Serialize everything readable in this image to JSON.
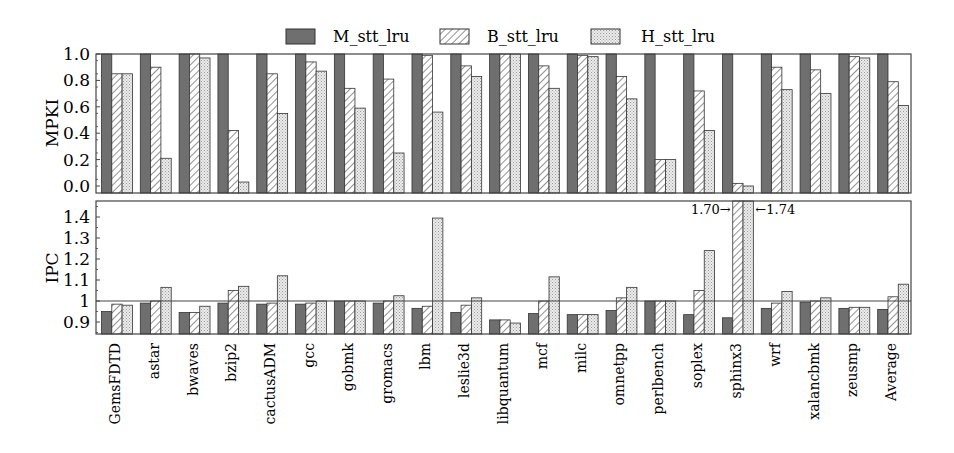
{
  "chart_data": [
    {
      "type": "bar",
      "title": "",
      "panel": "top",
      "ylabel": "MPKI",
      "xlabel": "",
      "ylim": [
        0.0,
        1.0
      ],
      "yticks": [
        "0.0",
        "0.2",
        "0.4",
        "0.6",
        "0.8",
        "1.0"
      ],
      "grid": false,
      "legend_position": "top-center",
      "categories": [
        "GemsFDTD",
        "astar",
        "bwaves",
        "bzip2",
        "cactusADM",
        "gcc",
        "gobmk",
        "gromacs",
        "lbm",
        "leslie3d",
        "libquantum",
        "mcf",
        "milc",
        "omnetpp",
        "perlbench",
        "soplex",
        "sphinx3",
        "wrf",
        "xalancbmk",
        "zeusmp",
        "Average"
      ],
      "series": [
        {
          "name": "M_stt_lru",
          "values": [
            1.0,
            1.0,
            1.0,
            1.0,
            1.0,
            1.0,
            1.0,
            1.0,
            1.0,
            1.0,
            1.0,
            1.0,
            1.0,
            1.0,
            1.0,
            1.0,
            1.0,
            1.0,
            1.0,
            1.0,
            1.0
          ]
        },
        {
          "name": "B_stt_lru",
          "values": [
            0.85,
            0.9,
            1.0,
            0.42,
            0.85,
            0.94,
            0.74,
            0.81,
            0.99,
            0.91,
            1.0,
            0.91,
            0.99,
            0.83,
            0.2,
            0.72,
            0.02,
            0.9,
            0.88,
            0.98,
            0.79
          ]
        },
        {
          "name": "H_stt_lru",
          "values": [
            0.85,
            0.21,
            0.97,
            0.03,
            0.55,
            0.87,
            0.59,
            0.25,
            0.56,
            0.83,
            1.0,
            0.74,
            0.98,
            0.66,
            0.2,
            0.42,
            0.0,
            0.73,
            0.7,
            0.97,
            0.61
          ]
        }
      ]
    },
    {
      "type": "bar",
      "title": "",
      "panel": "bottom",
      "ylabel": "IPC",
      "xlabel": "",
      "ylim": [
        0.85,
        1.48
      ],
      "yticks": [
        "0.9",
        "1",
        "1.1",
        "1.2",
        "1.3",
        "1.4"
      ],
      "reference_line": 1.0,
      "grid": false,
      "annotations": [
        {
          "text": "1.70→",
          "target": "sphinx3 B_stt_lru",
          "value": 1.7
        },
        {
          "text": "←1.74",
          "target": "sphinx3 H_stt_lru",
          "value": 1.74
        }
      ],
      "categories": [
        "GemsFDTD",
        "astar",
        "bwaves",
        "bzip2",
        "cactusADM",
        "gcc",
        "gobmk",
        "gromacs",
        "lbm",
        "leslie3d",
        "libquantum",
        "mcf",
        "milc",
        "omnetpp",
        "perlbench",
        "soplex",
        "sphinx3",
        "wrf",
        "xalancbmk",
        "zeusmp",
        "Average"
      ],
      "series": [
        {
          "name": "M_stt_lru",
          "values": [
            0.95,
            0.99,
            0.945,
            0.99,
            0.985,
            0.985,
            1.0,
            0.99,
            0.965,
            0.945,
            0.91,
            0.94,
            0.935,
            0.955,
            1.0,
            0.935,
            0.92,
            0.965,
            0.995,
            0.965,
            0.96
          ]
        },
        {
          "name": "B_stt_lru",
          "values": [
            0.985,
            1.0,
            0.945,
            1.05,
            0.99,
            0.99,
            1.0,
            1.0,
            0.975,
            0.98,
            0.91,
            1.0,
            0.935,
            1.015,
            1.0,
            1.05,
            1.7,
            0.99,
            1.0,
            0.97,
            1.02
          ]
        },
        {
          "name": "H_stt_lru",
          "values": [
            0.98,
            1.065,
            0.975,
            1.07,
            1.12,
            1.0,
            1.0,
            1.025,
            1.395,
            1.015,
            0.895,
            1.115,
            0.935,
            1.065,
            1.0,
            1.24,
            1.74,
            1.045,
            1.015,
            0.97,
            1.08
          ]
        }
      ]
    }
  ],
  "legend": {
    "items": [
      {
        "label": "M_stt_lru",
        "pattern": "solid-dark"
      },
      {
        "label": "B_stt_lru",
        "pattern": "diagonal-hatch"
      },
      {
        "label": "H_stt_lru",
        "pattern": "dotted-light"
      }
    ]
  },
  "axes": {
    "top_ylabel": "MPKI",
    "bottom_ylabel": "IPC"
  },
  "colors": {
    "m_fill": "#6f6f6f",
    "b_fill": "#ffffff",
    "h_fill": "#e6e6e6",
    "stroke": "#333333"
  }
}
